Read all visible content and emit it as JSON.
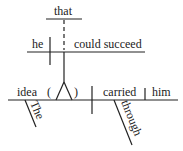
{
  "diagram": {
    "type": "sentence-diagram",
    "words": {
      "that": "that",
      "he": "he",
      "could_succeed": "could succeed",
      "idea": "idea",
      "paren_open": "(",
      "paren_close": ")",
      "carried": "carried",
      "him": "him",
      "the": "The",
      "through": "through"
    },
    "colors": {
      "line": "#222222",
      "background": "#ffffff"
    }
  }
}
